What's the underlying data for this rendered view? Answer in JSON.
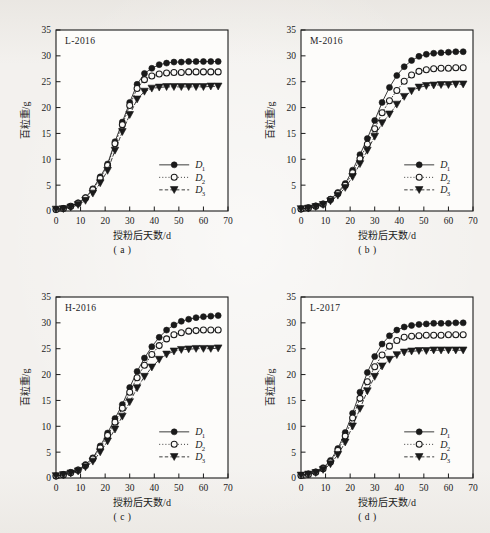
{
  "figure": {
    "background_color": "#f3f1ee",
    "ink_color": "#1a1a1a",
    "panel_count": 4,
    "axes": {
      "xlabel": "授粉后天数/d",
      "ylabel": "百粒重/g",
      "xlim": [
        0,
        70
      ],
      "ylim": [
        0,
        35
      ],
      "xticks": [
        0,
        10,
        20,
        30,
        40,
        50,
        60,
        70
      ],
      "yticks": [
        0,
        5,
        10,
        15,
        20,
        25,
        30,
        35
      ],
      "grid": false,
      "tick_direction": "in",
      "frame": "box"
    },
    "legend": {
      "position": "lower-right",
      "entries": [
        {
          "label": "D",
          "sub": "1",
          "marker": "filled-circle",
          "line": "solid"
        },
        {
          "label": "D",
          "sub": "2",
          "marker": "open-circle",
          "line": "dotted"
        },
        {
          "label": "D",
          "sub": "3",
          "marker": "filled-triangle-down",
          "line": "dashed"
        }
      ]
    }
  },
  "chart_data": [
    {
      "type": "line",
      "panel": "a",
      "caption": "( a )",
      "title": "L-2016",
      "xlabel": "授粉后天数/d",
      "ylabel": "百粒重/g",
      "xlim": [
        0,
        70
      ],
      "ylim": [
        0,
        35
      ],
      "x": [
        0,
        3,
        6,
        9,
        12,
        15,
        18,
        21,
        24,
        27,
        30,
        33,
        36,
        39,
        42,
        45,
        48,
        51,
        54,
        57,
        60,
        63,
        66
      ],
      "series": [
        {
          "name": "D1",
          "values": [
            0.3,
            0.5,
            0.9,
            1.6,
            2.6,
            4.3,
            6.6,
            9.1,
            13.4,
            17.2,
            21.0,
            24.5,
            26.6,
            27.6,
            28.3,
            28.6,
            28.8,
            28.8,
            28.9,
            28.9,
            28.9,
            28.9,
            28.9
          ]
        },
        {
          "name": "D2",
          "values": [
            0.3,
            0.5,
            0.9,
            1.5,
            2.5,
            4.1,
            6.3,
            8.8,
            13.0,
            16.7,
            20.4,
            23.7,
            25.4,
            26.1,
            26.5,
            26.7,
            26.8,
            26.8,
            26.9,
            26.9,
            26.9,
            26.9,
            26.9
          ]
        },
        {
          "name": "D3",
          "values": [
            0.3,
            0.4,
            0.7,
            1.2,
            2.0,
            3.4,
            5.4,
            7.8,
            11.7,
            15.3,
            18.6,
            21.6,
            23.1,
            23.7,
            23.9,
            24.0,
            24.0,
            24.0,
            24.0,
            24.0,
            24.0,
            24.1,
            24.1
          ]
        }
      ]
    },
    {
      "type": "line",
      "panel": "b",
      "caption": "( b )",
      "title": "M-2016",
      "xlabel": "授粉后天数/d",
      "ylabel": "百粒重/g",
      "xlim": [
        0,
        70
      ],
      "ylim": [
        0,
        35
      ],
      "x": [
        0,
        3,
        6,
        9,
        12,
        15,
        18,
        21,
        24,
        27,
        30,
        33,
        36,
        39,
        42,
        45,
        48,
        51,
        54,
        57,
        60,
        63,
        66
      ],
      "series": [
        {
          "name": "D1",
          "values": [
            0.4,
            0.6,
            1.0,
            1.4,
            2.3,
            3.6,
            5.3,
            7.9,
            10.9,
            14.0,
            17.5,
            21.0,
            23.9,
            26.2,
            27.9,
            29.1,
            29.9,
            30.3,
            30.5,
            30.6,
            30.7,
            30.8,
            30.8
          ]
        },
        {
          "name": "D2",
          "values": [
            0.4,
            0.6,
            0.9,
            1.3,
            2.2,
            3.4,
            5.0,
            7.4,
            10.1,
            12.9,
            15.9,
            19.0,
            21.3,
            23.3,
            25.1,
            26.3,
            27.0,
            27.3,
            27.5,
            27.6,
            27.6,
            27.7,
            27.7
          ]
        },
        {
          "name": "D3",
          "values": [
            0.4,
            0.5,
            0.8,
            1.2,
            1.9,
            3.0,
            4.5,
            6.6,
            9.1,
            11.7,
            14.4,
            17.0,
            18.7,
            20.6,
            22.1,
            23.2,
            23.9,
            24.2,
            24.3,
            24.4,
            24.4,
            24.5,
            24.5
          ]
        }
      ]
    },
    {
      "type": "line",
      "panel": "c",
      "caption": "( c )",
      "title": "H-2016",
      "xlabel": "授粉后天数/d",
      "ylabel": "百粒重/g",
      "xlim": [
        0,
        70
      ],
      "ylim": [
        0,
        35
      ],
      "x": [
        0,
        3,
        6,
        9,
        12,
        15,
        18,
        21,
        24,
        27,
        30,
        33,
        36,
        39,
        42,
        45,
        48,
        51,
        54,
        57,
        60,
        63,
        66
      ],
      "series": [
        {
          "name": "D1",
          "values": [
            0.4,
            0.7,
            1.1,
            1.6,
            2.6,
            3.9,
            6.2,
            8.7,
            11.5,
            14.2,
            17.5,
            20.6,
            23.2,
            25.4,
            27.2,
            28.6,
            29.6,
            30.3,
            30.7,
            31.0,
            31.2,
            31.3,
            31.4
          ]
        },
        {
          "name": "D2",
          "values": [
            0.4,
            0.6,
            1.0,
            1.5,
            2.4,
            3.7,
            5.8,
            8.2,
            10.8,
            13.5,
            16.6,
            19.4,
            21.8,
            23.9,
            25.6,
            26.9,
            27.7,
            28.1,
            28.4,
            28.5,
            28.6,
            28.6,
            28.6
          ]
        },
        {
          "name": "D3",
          "values": [
            0.4,
            0.6,
            0.9,
            1.3,
            2.1,
            3.2,
            5.0,
            7.1,
            9.4,
            11.9,
            14.7,
            17.4,
            19.6,
            21.4,
            22.9,
            23.9,
            24.5,
            24.8,
            24.9,
            25.0,
            25.0,
            25.0,
            25.1
          ]
        }
      ]
    },
    {
      "type": "line",
      "panel": "d",
      "caption": "( d )",
      "title": "L-2017",
      "xlabel": "授粉后天数/d",
      "ylabel": "百粒重/g",
      "xlim": [
        0,
        70
      ],
      "ylim": [
        0,
        35
      ],
      "x": [
        0,
        3,
        6,
        9,
        12,
        15,
        18,
        21,
        24,
        27,
        30,
        33,
        36,
        39,
        42,
        45,
        48,
        51,
        54,
        57,
        60,
        63,
        66
      ],
      "series": [
        {
          "name": "D1",
          "values": [
            0.5,
            0.8,
            1.2,
            2.0,
            3.4,
            5.7,
            8.8,
            12.5,
            16.6,
            20.4,
            23.5,
            25.9,
            27.5,
            28.6,
            29.2,
            29.5,
            29.7,
            29.8,
            29.9,
            29.9,
            29.9,
            30.0,
            30.0
          ]
        },
        {
          "name": "D2",
          "values": [
            0.5,
            0.7,
            1.1,
            1.8,
            3.1,
            5.3,
            8.1,
            11.6,
            15.4,
            18.6,
            21.5,
            23.8,
            25.5,
            26.6,
            27.2,
            27.4,
            27.5,
            27.6,
            27.6,
            27.6,
            27.7,
            27.7,
            27.7
          ]
        },
        {
          "name": "D3",
          "values": [
            0.5,
            0.7,
            1.0,
            1.6,
            2.7,
            4.5,
            6.9,
            10.0,
            13.4,
            16.8,
            19.6,
            21.6,
            22.9,
            23.8,
            24.3,
            24.5,
            24.6,
            24.6,
            24.7,
            24.7,
            24.7,
            24.7,
            24.7
          ]
        }
      ]
    }
  ]
}
